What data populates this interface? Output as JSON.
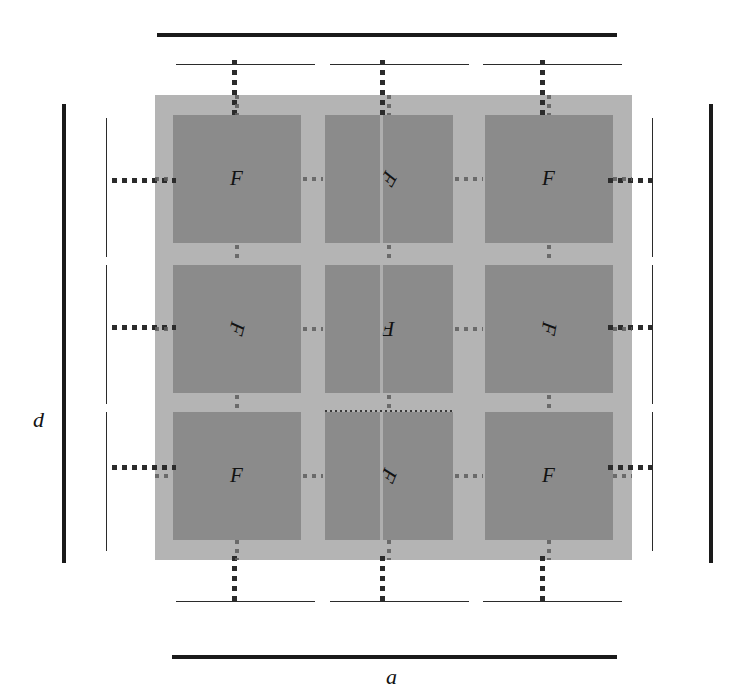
{
  "figure": {
    "width": 733,
    "height": 692,
    "background_color": "#ffffff"
  },
  "colors": {
    "plate": "#b4b4b4",
    "cell": "#8b8b8b",
    "rule_thick": "#1a1a1a",
    "rule_thin": "#2b2b2b",
    "dotted": "#2b2b2b",
    "dotted_faint": "#5d5d5d",
    "seam": "#b9b9b9",
    "text": "#121212"
  },
  "dimensions": {
    "overall_width": {
      "label": "a",
      "position": "bottom"
    },
    "overall_height": {
      "label": "d",
      "position": "left"
    }
  },
  "plate": {
    "x": 155,
    "y": 95,
    "width": 477,
    "height": 465
  },
  "grid": {
    "rows": 3,
    "cols": 3,
    "cell_width": 128,
    "cell_height": 128,
    "col_x": [
      173,
      325,
      485
    ],
    "row_y": [
      115,
      265,
      412
    ]
  },
  "cells": [
    {
      "id": "r1c1",
      "label": "F",
      "rotation": 0,
      "row": 1,
      "col": 1
    },
    {
      "id": "r1c2",
      "label": "F",
      "rotation": 118,
      "row": 1,
      "col": 2
    },
    {
      "id": "r1c3",
      "label": "F",
      "rotation": 0,
      "row": 1,
      "col": 3
    },
    {
      "id": "r2c1",
      "label": "F",
      "rotation": 104,
      "row": 2,
      "col": 1
    },
    {
      "id": "r2c2",
      "label": "F",
      "rotation": 180,
      "row": 2,
      "col": 2
    },
    {
      "id": "r2c3",
      "label": "F",
      "rotation": 100,
      "row": 2,
      "col": 3
    },
    {
      "id": "r3c1",
      "label": "F",
      "rotation": 0,
      "row": 3,
      "col": 1
    },
    {
      "id": "r3c2",
      "label": "F",
      "rotation": 112,
      "row": 3,
      "col": 2
    },
    {
      "id": "r3c3",
      "label": "F",
      "rotation": 0,
      "row": 3,
      "col": 3
    }
  ],
  "rules": {
    "top_thick": {
      "x": 157,
      "y": 33,
      "length": 460
    },
    "bottom_thick": {
      "x": 172,
      "y": 655,
      "length": 445
    },
    "left_thick": {
      "x": 62,
      "y": 104,
      "length": 459
    },
    "right_thick": {
      "x": 709,
      "y": 104,
      "length": 459
    },
    "top_thin": [
      {
        "x": 176,
        "y": 64,
        "length": 139
      },
      {
        "x": 330,
        "y": 64,
        "length": 139
      },
      {
        "x": 483,
        "y": 64,
        "length": 139
      }
    ],
    "bottom_thin": [
      {
        "x": 176,
        "y": 601,
        "length": 139
      },
      {
        "x": 330,
        "y": 601,
        "length": 139
      },
      {
        "x": 483,
        "y": 601,
        "length": 139
      }
    ],
    "left_thin": [
      {
        "x": 106,
        "y": 118,
        "length": 139
      },
      {
        "x": 106,
        "y": 265,
        "length": 139
      },
      {
        "x": 106,
        "y": 412,
        "length": 139
      }
    ],
    "right_thin": [
      {
        "x": 652,
        "y": 118,
        "length": 139
      },
      {
        "x": 652,
        "y": 265,
        "length": 139
      },
      {
        "x": 652,
        "y": 412,
        "length": 139
      }
    ]
  },
  "leaders": {
    "vertical_top": [
      {
        "x": 232,
        "y": 60,
        "length": 60
      },
      {
        "x": 380,
        "y": 60,
        "length": 60
      },
      {
        "x": 540,
        "y": 60,
        "length": 60
      }
    ],
    "vertical_bottom": [
      {
        "x": 232,
        "y": 556,
        "length": 50
      },
      {
        "x": 380,
        "y": 556,
        "length": 50
      },
      {
        "x": 540,
        "y": 556,
        "length": 50
      }
    ],
    "horizontal_left": [
      {
        "x": 112,
        "y": 178,
        "length": 64
      },
      {
        "x": 112,
        "y": 325,
        "length": 64
      },
      {
        "x": 112,
        "y": 465,
        "length": 64
      }
    ],
    "horizontal_right": [
      {
        "x": 608,
        "y": 178,
        "length": 48
      },
      {
        "x": 608,
        "y": 325,
        "length": 48
      },
      {
        "x": 608,
        "y": 465,
        "length": 48
      }
    ]
  }
}
